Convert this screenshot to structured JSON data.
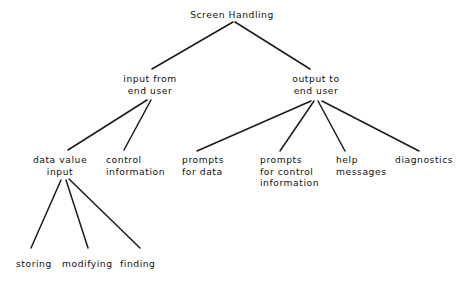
{
  "diagram": {
    "title": "Screen Handling",
    "type": "hierarchy-tree",
    "orientation": "top-down",
    "background_color": "#ffffff",
    "line_color": "#1a1a1a",
    "text_color": "#101010",
    "nodes": [
      {
        "id": "root",
        "level": 0,
        "lines": [
          "Screen Handling"
        ],
        "x": 232,
        "y": 9,
        "align": "centered"
      },
      {
        "id": "input-from-end-user",
        "level": 1,
        "lines": [
          "input from",
          "end user"
        ],
        "x": 150,
        "y": 73,
        "align": "centered"
      },
      {
        "id": "output-to-end-user",
        "level": 1,
        "lines": [
          "output to",
          "end user"
        ],
        "x": 316,
        "y": 73,
        "align": "centered"
      },
      {
        "id": "data-value-input",
        "level": 2,
        "lines": [
          "data value",
          "input"
        ],
        "x": 60,
        "y": 154,
        "align": "centered"
      },
      {
        "id": "control-information",
        "level": 2,
        "lines": [
          "control",
          "information"
        ],
        "x": 106,
        "y": 154,
        "align": "lefted"
      },
      {
        "id": "prompts-for-data",
        "level": 2,
        "lines": [
          "prompts",
          "for data"
        ],
        "x": 182,
        "y": 154,
        "align": "lefted"
      },
      {
        "id": "prompts-for-control-information",
        "level": 2,
        "lines": [
          "prompts",
          "for control",
          "information"
        ],
        "x": 260,
        "y": 154,
        "align": "lefted"
      },
      {
        "id": "help-messages",
        "level": 2,
        "lines": [
          "help",
          "messages"
        ],
        "x": 336,
        "y": 154,
        "align": "lefted"
      },
      {
        "id": "diagnostics",
        "level": 2,
        "lines": [
          "diagnostics"
        ],
        "x": 395,
        "y": 154,
        "align": "lefted"
      },
      {
        "id": "storing",
        "level": 3,
        "lines": [
          "storing"
        ],
        "x": 16,
        "y": 258,
        "align": "lefted"
      },
      {
        "id": "modifying",
        "level": 3,
        "lines": [
          "modifying"
        ],
        "x": 62,
        "y": 258,
        "align": "lefted"
      },
      {
        "id": "finding",
        "level": 3,
        "lines": [
          "finding"
        ],
        "x": 120,
        "y": 258,
        "align": "lefted"
      }
    ],
    "edges": [
      {
        "from": "root",
        "to": "input-from-end-user",
        "x1": 233,
        "y1": 22,
        "x2": 152,
        "y2": 69
      },
      {
        "from": "root",
        "to": "output-to-end-user",
        "x1": 235,
        "y1": 22,
        "x2": 310,
        "y2": 69
      },
      {
        "from": "input-from-end-user",
        "to": "data-value-input",
        "x1": 147,
        "y1": 100,
        "x2": 68,
        "y2": 150
      },
      {
        "from": "input-from-end-user",
        "to": "control-information",
        "x1": 151,
        "y1": 100,
        "x2": 124,
        "y2": 150
      },
      {
        "from": "output-to-end-user",
        "to": "prompts-for-data",
        "x1": 311,
        "y1": 101,
        "x2": 197,
        "y2": 151
      },
      {
        "from": "output-to-end-user",
        "to": "prompts-for-control-information",
        "x1": 314,
        "y1": 101,
        "x2": 280,
        "y2": 151
      },
      {
        "from": "output-to-end-user",
        "to": "help-messages",
        "x1": 318,
        "y1": 101,
        "x2": 345,
        "y2": 151
      },
      {
        "from": "output-to-end-user",
        "to": "diagnostics",
        "x1": 322,
        "y1": 101,
        "x2": 419,
        "y2": 151
      },
      {
        "from": "data-value-input",
        "to": "storing",
        "x1": 61,
        "y1": 180,
        "x2": 31,
        "y2": 248
      },
      {
        "from": "data-value-input",
        "to": "modifying",
        "x1": 66,
        "y1": 180,
        "x2": 88,
        "y2": 248
      },
      {
        "from": "data-value-input",
        "to": "finding",
        "x1": 69,
        "y1": 179,
        "x2": 140,
        "y2": 248
      }
    ]
  }
}
